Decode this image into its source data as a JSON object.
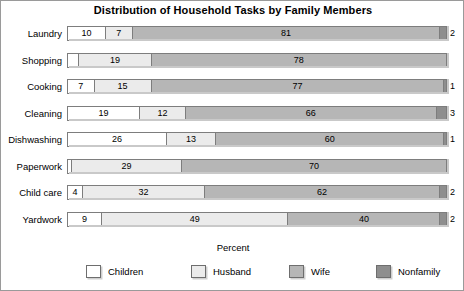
{
  "chart_data": {
    "type": "bar",
    "subtype": "horizontal-stacked-bar",
    "title": "Distribution of Household Tasks by Family Members",
    "xlabel": "Percent",
    "ylabel": "",
    "xlim": [
      0,
      100
    ],
    "grid": false,
    "legend_position": "bottom",
    "orientation": "horizontal",
    "stacked": true,
    "categories": [
      "Laundry",
      "Shopping",
      "Cooking",
      "Cleaning",
      "Dishwashing",
      "Paperwork",
      "Child care",
      "Yardwork"
    ],
    "series": [
      {
        "name": "Children",
        "color": "#ffffff",
        "values": [
          10,
          3,
          7,
          19,
          26,
          1,
          4,
          9
        ]
      },
      {
        "name": "Husband",
        "color": "#ebebeb",
        "values": [
          7,
          19,
          15,
          12,
          13,
          29,
          32,
          49
        ]
      },
      {
        "name": "Wife",
        "color": "#b6b6b6",
        "values": [
          81,
          78,
          77,
          66,
          60,
          70,
          62,
          40
        ]
      },
      {
        "name": "Nonfamily",
        "color": "#8e8e8e",
        "values": [
          2,
          0,
          1,
          3,
          1,
          0,
          2,
          2
        ]
      }
    ],
    "legend_entries": [
      "Children",
      "Husband",
      "Wife",
      "Nonfamily"
    ]
  },
  "colors": {
    "children": "#ffffff",
    "husband": "#ebebeb",
    "wife": "#b6b6b6",
    "nonfamily": "#8e8e8e",
    "segment_border": "#7d7d7d",
    "frame_border": "#9a9a9a",
    "shadow": "#c9c9c9",
    "text": "#000000"
  },
  "title": "Distribution of Household Tasks by Family Members",
  "axis_title": "Percent"
}
